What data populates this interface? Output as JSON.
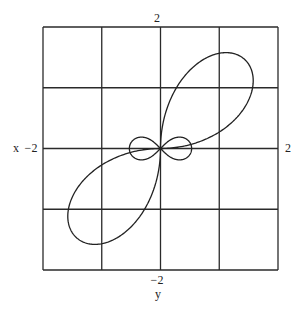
{
  "chart_data": {
    "type": "line",
    "title": "",
    "xlabel": "x",
    "ylabel": "y",
    "xlim": [
      -2,
      2
    ],
    "ylim": [
      -2,
      2
    ],
    "grid": true,
    "grid_step": 1,
    "tick_labels": {
      "top": "2",
      "bottom": "−2",
      "left": "−2",
      "right": "2"
    },
    "series": [
      {
        "name": "large-lobes",
        "description": "polar lobes in quadrants I and III, tangent to both axes at origin",
        "polar_form": "r = a*sin(2*theta)",
        "a": 2.05,
        "theta_ranges_deg": [
          [
            0,
            90
          ],
          [
            180,
            270
          ]
        ]
      },
      {
        "name": "small-loops",
        "description": "lemniscate figure-eight along the x-axis",
        "polar_form": "r^2 = a^2*cos(2*theta)",
        "a": 0.53
      }
    ],
    "colors": {
      "curve": "#222222",
      "grid": "#2a2a2a",
      "background": "#ffffff"
    }
  }
}
